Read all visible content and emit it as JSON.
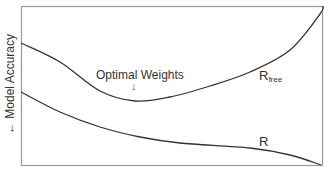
{
  "chart_data": {
    "type": "line",
    "title": "",
    "xlabel": "",
    "ylabel": "← Model Accuracy",
    "grid": false,
    "axis_ticks": false,
    "annotations": [
      {
        "text": "Optimal Weights",
        "arrow": "↓",
        "points_to": "minimum of R_free curve"
      }
    ],
    "series": [
      {
        "name": "R_free",
        "label_text": "R",
        "label_sub": "free",
        "points_px": [
          [
            21,
            43
          ],
          [
            60,
            62
          ],
          [
            100,
            91
          ],
          [
            135,
            101
          ],
          [
            170,
            97
          ],
          [
            210,
            86
          ],
          [
            250,
            72
          ],
          [
            290,
            50
          ],
          [
            320,
            14
          ],
          [
            323,
            6
          ]
        ]
      },
      {
        "name": "R",
        "label_text": "R",
        "label_sub": "",
        "points_px": [
          [
            21,
            92
          ],
          [
            60,
            112
          ],
          [
            100,
            127
          ],
          [
            140,
            137
          ],
          [
            180,
            143
          ],
          [
            250,
            148
          ],
          [
            290,
            155
          ],
          [
            321,
            165
          ]
        ]
      }
    ],
    "colors": {
      "axis": "#888888",
      "line": "#333333",
      "text": "#333333"
    }
  },
  "labels": {
    "ylabel": "← Model Accuracy",
    "annotation": "Optimal Weights",
    "annotation_arrow": "↓",
    "rfree_main": "R",
    "rfree_sub": "free",
    "r_main": "R"
  }
}
